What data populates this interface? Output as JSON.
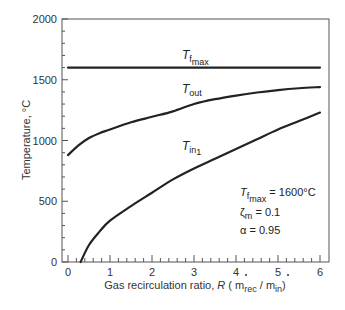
{
  "chart_data": {
    "type": "line",
    "title": "",
    "xlabel": "Gas recirculation ratio, R (ṁrec / ṁin)",
    "ylabel": "Temperature, °C",
    "xlim": [
      0,
      6
    ],
    "ylim": [
      0,
      2000
    ],
    "x_ticks": [
      0,
      1,
      2,
      3,
      4,
      5,
      6
    ],
    "y_ticks": [
      0,
      500,
      1000,
      1500,
      2000
    ],
    "grid": false,
    "legend": "inline labels",
    "series": [
      {
        "name": "T_f_max",
        "label_main": "T",
        "label_sub": "f",
        "label_subsub": "max",
        "x": [
          0,
          6
        ],
        "values": [
          1600,
          1600
        ]
      },
      {
        "name": "T_out",
        "label_main": "T",
        "label_sub": "out",
        "x": [
          0,
          0.25,
          0.5,
          0.75,
          1,
          1.5,
          2,
          2.5,
          3,
          3.5,
          4,
          4.5,
          5,
          5.5,
          6
        ],
        "values": [
          880,
          960,
          1020,
          1060,
          1090,
          1150,
          1195,
          1240,
          1300,
          1340,
          1370,
          1395,
          1415,
          1430,
          1440
        ]
      },
      {
        "name": "T_in1",
        "label_main": "T",
        "label_sub": "in",
        "label_subsub": "1",
        "x": [
          0.3,
          0.5,
          0.75,
          1,
          1.5,
          2,
          2.5,
          3,
          3.5,
          4,
          4.5,
          5,
          5.5,
          6
        ],
        "values": [
          0,
          140,
          250,
          340,
          460,
          570,
          680,
          770,
          850,
          930,
          1010,
          1090,
          1160,
          1230
        ]
      }
    ],
    "annotations": [
      {
        "main": "T",
        "sub": "f",
        "subsub": "max",
        "text": " = 1600°C"
      },
      {
        "main": "ζ",
        "sub": "m",
        "text": " = 0.1"
      },
      {
        "main": "α",
        "text": " = 0.95"
      }
    ]
  },
  "axes": {
    "ylabel": "Temperature, °C",
    "xlabel_prefix": "Gas recirculation ratio, ",
    "xlabel_R": "R",
    "xlabel_open": " ( ",
    "xlabel_m1": "m",
    "xlabel_m1_sub": "rec",
    "xlabel_slash": " / ",
    "xlabel_m2": "m",
    "xlabel_m2_sub": "in",
    "xlabel_close": ")"
  },
  "labels": {
    "tfmax_main": "T",
    "tfmax_sub": "f",
    "tfmax_subsub": "max",
    "tout_main": "T",
    "tout_sub": "out",
    "tin_main": "T",
    "tin_sub": "in",
    "tin_subsub": "1"
  },
  "annotation": {
    "line1_main": "T",
    "line1_sub": "f",
    "line1_subsub": "max",
    "line1_text": " = 1600°C",
    "line2_main": "ζ",
    "line2_sub": "m",
    "line2_text": " = 0.1",
    "line3_main": "α",
    "line3_text": " = 0.95"
  }
}
